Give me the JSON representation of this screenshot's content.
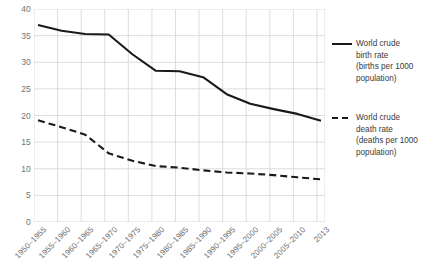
{
  "chart_data": {
    "type": "line",
    "title": "",
    "xlabel": "",
    "ylabel": "",
    "ylim": [
      0,
      40
    ],
    "y_ticks": [
      0,
      5,
      10,
      15,
      20,
      25,
      30,
      35,
      40
    ],
    "grid": true,
    "legend_position": "right",
    "categories": [
      "1950–1955",
      "1955–1960",
      "1960–1965",
      "1965–1970",
      "1970–1975",
      "1975–1980",
      "1980–1985",
      "1985–1990",
      "1990–1995",
      "1995–2000",
      "2000–2005",
      "2005–2010",
      "2013"
    ],
    "series": [
      {
        "name": "World crude birth rate (births per 1000 population)",
        "style": "solid",
        "color": "#1a1a1a",
        "values": [
          37,
          35.9,
          35.3,
          35.2,
          31.5,
          28.4,
          28.3,
          27.2,
          24,
          22.2,
          21.2,
          20.3,
          19
        ]
      },
      {
        "name": "World crude death rate (deaths per 1000 population)",
        "style": "dashed",
        "color": "#1a1a1a",
        "values": [
          19.1,
          17.8,
          16.4,
          12.9,
          11.5,
          10.5,
          10.2,
          9.7,
          9.3,
          9.1,
          8.8,
          8.4,
          8
        ]
      }
    ]
  },
  "legend": {
    "items": [
      {
        "id": "birth",
        "lines": [
          "World crude",
          "birth rate",
          "(births per 1000",
          "population)"
        ]
      },
      {
        "id": "death",
        "lines": [
          "World crude",
          "death rate",
          "(deaths per 1000",
          "population)"
        ]
      }
    ]
  },
  "axis": {
    "y_tick_labels": [
      "40",
      "35",
      "30",
      "25",
      "20",
      "15",
      "10",
      "5",
      "0"
    ]
  }
}
